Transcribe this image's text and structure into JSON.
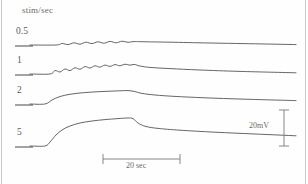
{
  "figure": {
    "axis_title": "stim/sec",
    "background_color": "#fefefe",
    "trace_color": "#4a4a48"
  },
  "scale_bars": {
    "horizontal_label": "20 sec",
    "vertical_label": "20mV"
  },
  "rows": [
    {
      "label": "0.5"
    },
    {
      "label": "1"
    },
    {
      "label": "2"
    },
    {
      "label": "5"
    }
  ],
  "chart_data": {
    "type": "line",
    "title": "",
    "xlabel": "",
    "ylabel": "stim/sec",
    "grid": false,
    "legend": "none",
    "annotations": [
      "20 sec",
      "20mV"
    ],
    "series": [
      {
        "name": "0.5",
        "stim_rate_per_sec": 0.5,
        "description": "small rippled depolarization, slow decay",
        "baseline_y_px": 45,
        "peak_amplitude_mV": 3,
        "points": [
          [
            30,
            45
          ],
          [
            56,
            45
          ],
          [
            62,
            43.4
          ],
          [
            68,
            44.6
          ],
          [
            74,
            42.8
          ],
          [
            80,
            44.2
          ],
          [
            86,
            42.2
          ],
          [
            92,
            43.6
          ],
          [
            98,
            41.8
          ],
          [
            104,
            43.2
          ],
          [
            110,
            41.4
          ],
          [
            116,
            42.8
          ],
          [
            122,
            41.2
          ],
          [
            128,
            42.3
          ],
          [
            134,
            41.6
          ],
          [
            146,
            41.8
          ],
          [
            170,
            42.2
          ],
          [
            210,
            43.0
          ],
          [
            260,
            43.9
          ],
          [
            296,
            44.6
          ]
        ]
      },
      {
        "name": "1",
        "stim_rate_per_sec": 1,
        "description": "denser ripples, larger plateau, slow decay",
        "baseline_y_px": 74,
        "peak_amplitude_mV": 6,
        "points": [
          [
            30,
            74
          ],
          [
            50,
            74
          ],
          [
            55,
            70.5
          ],
          [
            60,
            72.0
          ],
          [
            65,
            69.0
          ],
          [
            70,
            70.6
          ],
          [
            75,
            67.8
          ],
          [
            80,
            69.2
          ],
          [
            85,
            66.6
          ],
          [
            90,
            68.0
          ],
          [
            95,
            65.8
          ],
          [
            100,
            67.1
          ],
          [
            105,
            65.1
          ],
          [
            110,
            66.4
          ],
          [
            115,
            64.6
          ],
          [
            120,
            65.8
          ],
          [
            125,
            64.2
          ],
          [
            130,
            65.2
          ],
          [
            134,
            64.4
          ],
          [
            140,
            66.0
          ],
          [
            150,
            67.4
          ],
          [
            170,
            68.6
          ],
          [
            200,
            70.0
          ],
          [
            240,
            71.4
          ],
          [
            296,
            72.8
          ]
        ]
      },
      {
        "name": "2",
        "stim_rate_per_sec": 2,
        "description": "smooth rise with fine ripple on plateau, decay after stimulus",
        "baseline_y_px": 104,
        "peak_amplitude_mV": 12,
        "points": [
          [
            30,
            104
          ],
          [
            45,
            104
          ],
          [
            52,
            100
          ],
          [
            60,
            96.5
          ],
          [
            70,
            94.3
          ],
          [
            80,
            93.0
          ],
          [
            90,
            92.2
          ],
          [
            100,
            91.6
          ],
          [
            110,
            91.2
          ],
          [
            120,
            90.8
          ],
          [
            128,
            90.6
          ],
          [
            134,
            91.4
          ],
          [
            142,
            93.4
          ],
          [
            155,
            95.0
          ],
          [
            175,
            96.4
          ],
          [
            205,
            97.8
          ],
          [
            245,
            99.2
          ],
          [
            296,
            100.6
          ]
        ]
      },
      {
        "name": "5",
        "stim_rate_per_sec": 5,
        "description": "largest smooth depolarization, sharp peak then decay",
        "baseline_y_px": 146,
        "peak_amplitude_mV": 22,
        "points": [
          [
            30,
            146
          ],
          [
            45,
            146
          ],
          [
            50,
            142
          ],
          [
            56,
            135
          ],
          [
            62,
            130
          ],
          [
            70,
            126
          ],
          [
            80,
            123
          ],
          [
            92,
            121
          ],
          [
            105,
            119.6
          ],
          [
            118,
            118.6
          ],
          [
            128,
            118.0
          ],
          [
            133,
            118.6
          ],
          [
            138,
            123
          ],
          [
            146,
            126.5
          ],
          [
            158,
            128.4
          ],
          [
            180,
            130.2
          ],
          [
            215,
            132.2
          ],
          [
            255,
            134.0
          ],
          [
            296,
            135.8
          ]
        ]
      }
    ],
    "horizontal_scale_bar": {
      "label": "20 sec",
      "x_start_px": 103,
      "x_end_px": 180,
      "y_px": 159
    },
    "vertical_scale_bar": {
      "label": "20mV",
      "x_px": 284,
      "y_start_px": 110,
      "y_end_px": 146
    }
  }
}
